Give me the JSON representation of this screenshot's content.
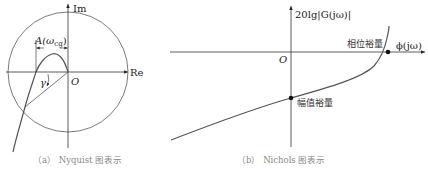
{
  "nyquist": {
    "im_label": "Im",
    "re_label": "Re",
    "origin_label": "O",
    "amplitude_label": "A(ω",
    "amplitude_sub": "cg",
    "amplitude_close": ")",
    "gamma_label": "γ",
    "caption": "（a） Nyquist 图表示"
  },
  "nichols": {
    "y_label": "20lg|G(jω)|",
    "x_label": "ϕ(jω)",
    "origin_label": "O",
    "phase_margin_label": "相位裕量",
    "gain_margin_label": "幅值裕量",
    "caption": "（b） Nichols 图表示"
  }
}
